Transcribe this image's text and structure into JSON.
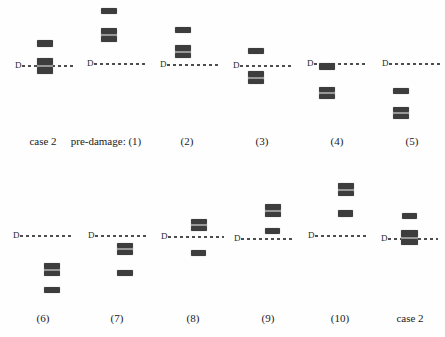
{
  "figure": {
    "width": 445,
    "height": 337,
    "background": "#fefefe",
    "band_color": "#3d3d3d",
    "band_seam_color": "#979797",
    "dash_color": "#4d4d4d",
    "text_color": "#1a1a1a",
    "d_label": "D"
  },
  "panels": [
    {
      "id": "top-case2",
      "label": "case 2",
      "row": "top",
      "d": {
        "x": 15,
        "y": 66
      },
      "line_len": 54,
      "label_cx": 43,
      "label_y": 135,
      "bands": [
        {
          "kind": "single",
          "x": 37,
          "y": 40,
          "w": 16,
          "h": 7
        },
        {
          "kind": "double",
          "x": 37,
          "y": 58,
          "w": 16,
          "h": 16
        }
      ]
    },
    {
      "id": "top-1",
      "label": "pre-damage: (1)",
      "row": "top",
      "d": {
        "x": 87,
        "y": 64
      },
      "line_len": 54,
      "label_cx": 106,
      "label_y": 135,
      "bands": [
        {
          "kind": "single",
          "x": 101,
          "y": 8,
          "w": 16,
          "h": 6
        },
        {
          "kind": "double",
          "x": 101,
          "y": 28,
          "w": 16,
          "h": 14
        }
      ]
    },
    {
      "id": "top-2",
      "label": "(2)",
      "row": "top",
      "d": {
        "x": 160,
        "y": 65
      },
      "line_len": 54,
      "label_cx": 187,
      "label_y": 135,
      "bands": [
        {
          "kind": "single",
          "x": 175,
          "y": 27,
          "w": 16,
          "h": 6
        },
        {
          "kind": "double",
          "x": 175,
          "y": 45,
          "w": 16,
          "h": 13
        }
      ]
    },
    {
      "id": "top-3",
      "label": "(3)",
      "row": "top",
      "d": {
        "x": 233,
        "y": 66
      },
      "line_len": 54,
      "label_cx": 262,
      "label_y": 135,
      "bands": [
        {
          "kind": "single",
          "x": 248,
          "y": 48,
          "w": 16,
          "h": 6
        },
        {
          "kind": "double",
          "x": 248,
          "y": 71,
          "w": 16,
          "h": 13
        }
      ]
    },
    {
      "id": "top-4",
      "label": "(4)",
      "row": "top",
      "d": {
        "x": 307,
        "y": 64
      },
      "line_len": 54,
      "label_cx": 337,
      "label_y": 135,
      "bands": [
        {
          "kind": "single",
          "x": 319,
          "y": 63,
          "w": 16,
          "h": 7
        },
        {
          "kind": "double",
          "x": 319,
          "y": 87,
          "w": 16,
          "h": 12
        }
      ]
    },
    {
      "id": "top-5",
      "label": "(5)",
      "row": "top",
      "d": {
        "x": 382,
        "y": 64
      },
      "line_len": 53,
      "label_cx": 412,
      "label_y": 135,
      "bands": [
        {
          "kind": "single",
          "x": 393,
          "y": 88,
          "w": 16,
          "h": 6
        },
        {
          "kind": "double",
          "x": 393,
          "y": 107,
          "w": 16,
          "h": 12
        }
      ]
    },
    {
      "id": "bottom-6",
      "label": "(6)",
      "row": "bottom",
      "d": {
        "x": 13,
        "y": 236
      },
      "line_len": 54,
      "label_cx": 43,
      "label_y": 312,
      "bands": [
        {
          "kind": "double",
          "x": 44,
          "y": 263,
          "w": 16,
          "h": 13
        },
        {
          "kind": "single",
          "x": 44,
          "y": 287,
          "w": 16,
          "h": 6
        }
      ]
    },
    {
      "id": "bottom-7",
      "label": "(7)",
      "row": "bottom",
      "d": {
        "x": 88,
        "y": 236
      },
      "line_len": 54,
      "label_cx": 117,
      "label_y": 312,
      "bands": [
        {
          "kind": "double",
          "x": 117,
          "y": 243,
          "w": 16,
          "h": 12
        },
        {
          "kind": "single",
          "x": 117,
          "y": 270,
          "w": 16,
          "h": 6
        }
      ]
    },
    {
      "id": "bottom-8",
      "label": "(8)",
      "row": "bottom",
      "d": {
        "x": 161,
        "y": 237
      },
      "line_len": 56,
      "label_cx": 193,
      "label_y": 312,
      "bands": [
        {
          "kind": "double",
          "x": 191,
          "y": 219,
          "w": 16,
          "h": 12
        },
        {
          "kind": "single",
          "x": 191,
          "y": 250,
          "w": 15,
          "h": 6
        }
      ]
    },
    {
      "id": "bottom-9",
      "label": "(9)",
      "row": "bottom",
      "d": {
        "x": 234,
        "y": 239
      },
      "line_len": 54,
      "label_cx": 268,
      "label_y": 312,
      "bands": [
        {
          "kind": "double",
          "x": 265,
          "y": 204,
          "w": 16,
          "h": 13
        },
        {
          "kind": "single",
          "x": 265,
          "y": 228,
          "w": 15,
          "h": 6
        }
      ]
    },
    {
      "id": "bottom-10",
      "label": "(10)",
      "row": "bottom",
      "d": {
        "x": 308,
        "y": 236
      },
      "line_len": 52,
      "label_cx": 340,
      "label_y": 312,
      "bands": [
        {
          "kind": "double",
          "x": 338,
          "y": 183,
          "w": 16,
          "h": 13
        },
        {
          "kind": "single",
          "x": 338,
          "y": 210,
          "w": 15,
          "h": 7
        }
      ]
    },
    {
      "id": "bottom-case2",
      "label": "case 2",
      "row": "bottom",
      "d": {
        "x": 381,
        "y": 239
      },
      "line_len": 50,
      "label_cx": 410,
      "label_y": 312,
      "bands": [
        {
          "kind": "single",
          "x": 402,
          "y": 213,
          "w": 15,
          "h": 6
        },
        {
          "kind": "double",
          "x": 401,
          "y": 230,
          "w": 17,
          "h": 15
        }
      ]
    }
  ]
}
